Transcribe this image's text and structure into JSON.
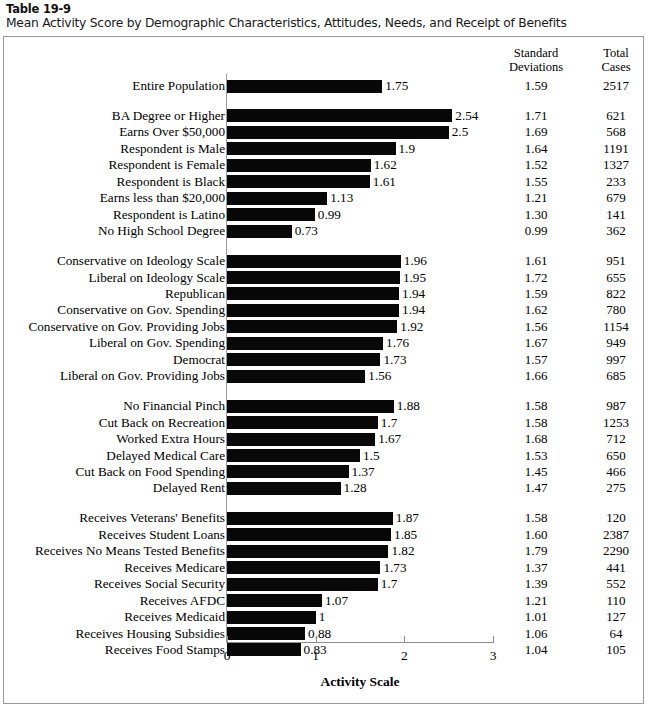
{
  "header": {
    "table_number": "Table 19-9",
    "title": "Mean Activity Score by Demographic Characteristics, Attitudes, Needs, and Receipt of Benefits"
  },
  "columns": {
    "sd_header_line1": "Standard",
    "sd_header_line2": "Deviations",
    "tc_header_line1": "Total",
    "tc_header_line2": "Cases"
  },
  "chart_data": {
    "type": "bar",
    "orientation": "horizontal",
    "title": "Mean Activity Score by Demographic Characteristics, Attitudes, Needs, and Receipt of Benefits",
    "xlabel": "Activity Scale",
    "ylabel": "",
    "xlim": [
      0,
      3
    ],
    "xticks": [
      0,
      1,
      2,
      3
    ],
    "xtick_labels": [
      "0",
      "1",
      "2",
      "3"
    ],
    "grid": false,
    "legend": null,
    "bar_color": "#080808",
    "extra_columns": [
      "Standard Deviations",
      "Total Cases"
    ],
    "groups": [
      {
        "name": "overall",
        "rows": [
          {
            "label": "Entire Population",
            "value": 1.75,
            "value_label": "1.75",
            "sd": "1.59",
            "cases": "2517"
          }
        ]
      },
      {
        "name": "demographics",
        "rows": [
          {
            "label": "BA Degree or Higher",
            "value": 2.54,
            "value_label": "2.54",
            "sd": "1.71",
            "cases": "621"
          },
          {
            "label": "Earns Over $50,000",
            "value": 2.5,
            "value_label": "2.5",
            "sd": "1.69",
            "cases": "568"
          },
          {
            "label": "Respondent is Male",
            "value": 1.9,
            "value_label": "1.9",
            "sd": "1.64",
            "cases": "1191"
          },
          {
            "label": "Respondent is Female",
            "value": 1.62,
            "value_label": "1.62",
            "sd": "1.52",
            "cases": "1327"
          },
          {
            "label": "Respondent is Black",
            "value": 1.61,
            "value_label": "1.61",
            "sd": "1.55",
            "cases": "233"
          },
          {
            "label": "Earns less than $20,000",
            "value": 1.13,
            "value_label": "1.13",
            "sd": "1.21",
            "cases": "679"
          },
          {
            "label": "Respondent is Latino",
            "value": 0.99,
            "value_label": "0.99",
            "sd": "1.30",
            "cases": "141"
          },
          {
            "label": "No High School Degree",
            "value": 0.73,
            "value_label": "0.73",
            "sd": "0.99",
            "cases": "362"
          }
        ]
      },
      {
        "name": "attitudes",
        "rows": [
          {
            "label": "Conservative on Ideology Scale",
            "value": 1.96,
            "value_label": "1.96",
            "sd": "1.61",
            "cases": "951"
          },
          {
            "label": "Liberal on Ideology Scale",
            "value": 1.95,
            "value_label": "1.95",
            "sd": "1.72",
            "cases": "655"
          },
          {
            "label": "Republican",
            "value": 1.94,
            "value_label": "1.94",
            "sd": "1.59",
            "cases": "822"
          },
          {
            "label": "Conservative on Gov. Spending",
            "value": 1.94,
            "value_label": "1.94",
            "sd": "1.62",
            "cases": "780"
          },
          {
            "label": "Conservative on Gov. Providing Jobs",
            "value": 1.92,
            "value_label": "1.92",
            "sd": "1.56",
            "cases": "1154"
          },
          {
            "label": "Liberal on Gov. Spending",
            "value": 1.76,
            "value_label": "1.76",
            "sd": "1.67",
            "cases": "949"
          },
          {
            "label": "Democrat",
            "value": 1.73,
            "value_label": "1.73",
            "sd": "1.57",
            "cases": "997"
          },
          {
            "label": "Liberal on Gov. Providing Jobs",
            "value": 1.56,
            "value_label": "1.56",
            "sd": "1.66",
            "cases": "685"
          }
        ]
      },
      {
        "name": "needs",
        "rows": [
          {
            "label": "No Financial Pinch",
            "value": 1.88,
            "value_label": "1.88",
            "sd": "1.58",
            "cases": "987"
          },
          {
            "label": "Cut Back on Recreation",
            "value": 1.7,
            "value_label": "1.7",
            "sd": "1.58",
            "cases": "1253"
          },
          {
            "label": "Worked Extra Hours",
            "value": 1.67,
            "value_label": "1.67",
            "sd": "1.68",
            "cases": "712"
          },
          {
            "label": "Delayed Medical Care",
            "value": 1.5,
            "value_label": "1.5",
            "sd": "1.53",
            "cases": "650"
          },
          {
            "label": "Cut Back on Food Spending",
            "value": 1.37,
            "value_label": "1.37",
            "sd": "1.45",
            "cases": "466"
          },
          {
            "label": "Delayed Rent",
            "value": 1.28,
            "value_label": "1.28",
            "sd": "1.47",
            "cases": "275"
          }
        ]
      },
      {
        "name": "receipt-of-benefits",
        "rows": [
          {
            "label": "Receives Veterans' Benefits",
            "value": 1.87,
            "value_label": "1.87",
            "sd": "1.58",
            "cases": "120"
          },
          {
            "label": "Receives Student Loans",
            "value": 1.85,
            "value_label": "1.85",
            "sd": "1.60",
            "cases": "2387"
          },
          {
            "label": "Receives No Means Tested Benefits",
            "value": 1.82,
            "value_label": "1.82",
            "sd": "1.79",
            "cases": "2290"
          },
          {
            "label": "Receives Medicare",
            "value": 1.73,
            "value_label": "1.73",
            "sd": "1.37",
            "cases": "441"
          },
          {
            "label": "Receives Social Security",
            "value": 1.7,
            "value_label": "1.7",
            "sd": "1.39",
            "cases": "552"
          },
          {
            "label": "Receives AFDC",
            "value": 1.07,
            "value_label": "1.07",
            "sd": "1.21",
            "cases": "110"
          },
          {
            "label": "Receives Medicaid",
            "value": 1,
            "value_label": "1",
            "sd": "1.01",
            "cases": "127"
          },
          {
            "label": "Receives Housing Subsidies",
            "value": 0.88,
            "value_label": "0.88",
            "sd": "1.06",
            "cases": "64"
          },
          {
            "label": "Receives Food Stamps",
            "value": 0.83,
            "value_label": "0.83",
            "sd": "1.04",
            "cases": "105"
          }
        ]
      }
    ]
  }
}
